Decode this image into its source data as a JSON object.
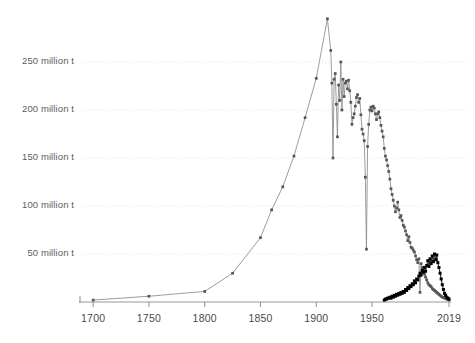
{
  "chart_data": {
    "type": "line",
    "title": "",
    "subtitle": "",
    "xlabel": "",
    "ylabel": "",
    "xlim": [
      1690,
      2019
    ],
    "ylim": [
      0,
      300
    ],
    "grid": true,
    "legend_position": "none",
    "y_ticks": [
      50,
      100,
      150,
      200,
      250
    ],
    "y_tick_labels": [
      "50 million t",
      "100 million t",
      "150 million t",
      "200 million t",
      "250 million t"
    ],
    "x_ticks": [
      1700,
      1750,
      1800,
      1850,
      1900,
      1950,
      2019
    ],
    "x_tick_labels": [
      "1700",
      "1750",
      "1800",
      "1850",
      "1900",
      "1950",
      "2019"
    ],
    "series": [
      {
        "name": "primary-series",
        "color": "#8a8a8a",
        "marker_color": "#555555",
        "points": [
          [
            1700,
            2
          ],
          [
            1750,
            6
          ],
          [
            1800,
            11
          ],
          [
            1825,
            30
          ],
          [
            1850,
            67
          ],
          [
            1860,
            96
          ],
          [
            1870,
            120
          ],
          [
            1880,
            152
          ],
          [
            1890,
            192
          ],
          [
            1900,
            233
          ],
          [
            1910,
            295
          ],
          [
            1913,
            262
          ],
          [
            1914,
            228
          ],
          [
            1915,
            150
          ],
          [
            1916,
            232
          ],
          [
            1917,
            238
          ],
          [
            1918,
            206
          ],
          [
            1919,
            172
          ],
          [
            1920,
            226
          ],
          [
            1921,
            210
          ],
          [
            1922,
            250
          ],
          [
            1923,
            200
          ],
          [
            1924,
            232
          ],
          [
            1925,
            214
          ],
          [
            1926,
            228
          ],
          [
            1927,
            230
          ],
          [
            1928,
            222
          ],
          [
            1929,
            231
          ],
          [
            1930,
            220
          ],
          [
            1931,
            208
          ],
          [
            1932,
            185
          ],
          [
            1933,
            192
          ],
          [
            1934,
            196
          ],
          [
            1935,
            204
          ],
          [
            1936,
            213
          ],
          [
            1937,
            216
          ],
          [
            1938,
            208
          ],
          [
            1939,
            212
          ],
          [
            1940,
            195
          ],
          [
            1941,
            180
          ],
          [
            1942,
            175
          ],
          [
            1943,
            168
          ],
          [
            1944,
            130
          ],
          [
            1945,
            55
          ],
          [
            1946,
            162
          ],
          [
            1947,
            185
          ],
          [
            1948,
            200
          ],
          [
            1949,
            203
          ],
          [
            1950,
            199
          ],
          [
            1951,
            204
          ],
          [
            1952,
            202
          ],
          [
            1953,
            196
          ],
          [
            1954,
            190
          ],
          [
            1955,
            196
          ],
          [
            1956,
            198
          ],
          [
            1957,
            192
          ],
          [
            1958,
            184
          ],
          [
            1959,
            178
          ],
          [
            1960,
            172
          ],
          [
            1961,
            160
          ],
          [
            1962,
            152
          ],
          [
            1963,
            148
          ],
          [
            1964,
            142
          ],
          [
            1965,
            136
          ],
          [
            1966,
            128
          ],
          [
            1967,
            118
          ],
          [
            1968,
            112
          ],
          [
            1969,
            106
          ],
          [
            1970,
            100
          ],
          [
            1971,
            94
          ],
          [
            1972,
            98
          ],
          [
            1973,
            104
          ],
          [
            1974,
            96
          ],
          [
            1975,
            88
          ],
          [
            1976,
            90
          ],
          [
            1977,
            85
          ],
          [
            1978,
            80
          ],
          [
            1979,
            78
          ],
          [
            1980,
            74
          ],
          [
            1981,
            70
          ],
          [
            1982,
            64
          ],
          [
            1983,
            68
          ],
          [
            1984,
            62
          ],
          [
            1985,
            57
          ],
          [
            1986,
            56
          ],
          [
            1987,
            54
          ],
          [
            1988,
            52
          ],
          [
            1989,
            48
          ],
          [
            1990,
            44
          ],
          [
            1991,
            41
          ],
          [
            1992,
            45
          ],
          [
            1993,
            10
          ],
          [
            1994,
            40
          ],
          [
            1995,
            36
          ],
          [
            1996,
            32
          ],
          [
            1997,
            29
          ],
          [
            1998,
            26
          ],
          [
            1999,
            23
          ],
          [
            2000,
            20
          ],
          [
            2001,
            18
          ],
          [
            2002,
            17
          ],
          [
            2003,
            16
          ],
          [
            2004,
            14
          ],
          [
            2005,
            13
          ],
          [
            2006,
            12
          ],
          [
            2007,
            11
          ],
          [
            2008,
            10
          ],
          [
            2009,
            9
          ],
          [
            2010,
            8
          ],
          [
            2011,
            7
          ],
          [
            2012,
            6
          ],
          [
            2013,
            5
          ],
          [
            2014,
            5
          ],
          [
            2015,
            4
          ],
          [
            2016,
            4
          ],
          [
            2017,
            3
          ],
          [
            2018,
            3
          ],
          [
            2019,
            2
          ]
        ]
      },
      {
        "name": "secondary-series",
        "color": "#1c1c1c",
        "marker_color": "#000000",
        "points": [
          [
            1961,
            2
          ],
          [
            1962,
            3
          ],
          [
            1963,
            3
          ],
          [
            1964,
            4
          ],
          [
            1965,
            4
          ],
          [
            1966,
            5
          ],
          [
            1967,
            4
          ],
          [
            1968,
            6
          ],
          [
            1969,
            5
          ],
          [
            1970,
            7
          ],
          [
            1971,
            6
          ],
          [
            1972,
            8
          ],
          [
            1973,
            7
          ],
          [
            1974,
            9
          ],
          [
            1975,
            8
          ],
          [
            1976,
            10
          ],
          [
            1977,
            9
          ],
          [
            1978,
            11
          ],
          [
            1979,
            10
          ],
          [
            1980,
            13
          ],
          [
            1981,
            12
          ],
          [
            1982,
            15
          ],
          [
            1983,
            14
          ],
          [
            1984,
            17
          ],
          [
            1985,
            16
          ],
          [
            1986,
            19
          ],
          [
            1987,
            18
          ],
          [
            1988,
            22
          ],
          [
            1989,
            20
          ],
          [
            1990,
            24
          ],
          [
            1991,
            23
          ],
          [
            1992,
            27
          ],
          [
            1993,
            30
          ],
          [
            1994,
            28
          ],
          [
            1995,
            33
          ],
          [
            1996,
            31
          ],
          [
            1997,
            36
          ],
          [
            1998,
            32
          ],
          [
            1999,
            38
          ],
          [
            2000,
            43
          ],
          [
            2001,
            37
          ],
          [
            2002,
            45
          ],
          [
            2003,
            40
          ],
          [
            2004,
            48
          ],
          [
            2005,
            42
          ],
          [
            2006,
            50
          ],
          [
            2007,
            44
          ],
          [
            2008,
            49
          ],
          [
            2009,
            41
          ],
          [
            2010,
            36
          ],
          [
            2011,
            30
          ],
          [
            2012,
            24
          ],
          [
            2013,
            18
          ],
          [
            2014,
            13
          ],
          [
            2015,
            9
          ],
          [
            2016,
            7
          ],
          [
            2017,
            5
          ],
          [
            2018,
            4
          ],
          [
            2019,
            3
          ]
        ]
      }
    ]
  },
  "axes": {
    "axis_color": "#9a9a9a",
    "grid_color": "#e8e8e8",
    "tick_color": "#8f8f8f"
  }
}
